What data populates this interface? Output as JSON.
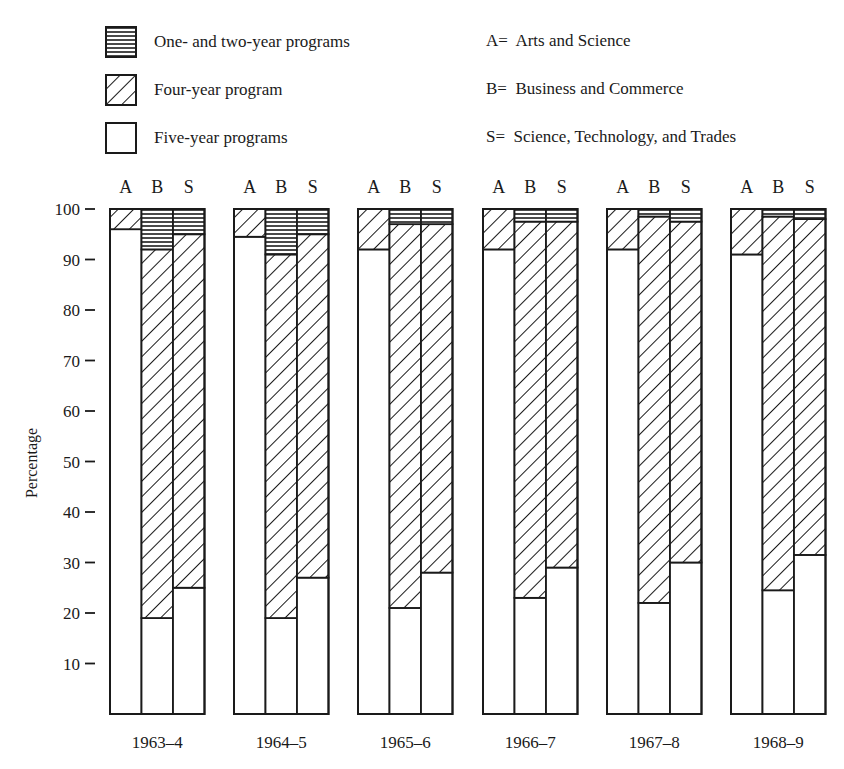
{
  "legend": {
    "series": [
      {
        "key": "one_two",
        "label": "One- and two-year programs",
        "pattern": "horizontal-lines"
      },
      {
        "key": "four",
        "label": "Four-year program",
        "pattern": "diagonal-hatch"
      },
      {
        "key": "five",
        "label": "Five-year programs",
        "pattern": "blank"
      }
    ],
    "keys": [
      {
        "letter": "A",
        "text": "A=  Arts and Science"
      },
      {
        "letter": "B",
        "text": "B=  Business and Commerce"
      },
      {
        "letter": "S",
        "text": "S=  Science, Technology, and Trades"
      }
    ]
  },
  "chart_data": {
    "type": "bar",
    "stacked": true,
    "title": "",
    "xlabel": "",
    "ylabel": "Percentage",
    "ylim": [
      0,
      100
    ],
    "yticks": [
      10,
      20,
      30,
      40,
      50,
      60,
      70,
      80,
      90,
      100
    ],
    "grid": false,
    "legend_position": "top",
    "categories": [
      "1963–4",
      "1964–5",
      "1965–6",
      "1966–7",
      "1967–8",
      "1968–9"
    ],
    "subcategories": [
      "A",
      "B",
      "S"
    ],
    "subcategory_names": {
      "A": "Arts and Science",
      "B": "Business and Commerce",
      "S": "Science, Technology, and Trades"
    },
    "series": [
      {
        "name": "Five-year programs",
        "key": "five",
        "values": {
          "A": [
            96,
            94.5,
            92,
            92,
            92,
            91
          ],
          "B": [
            19,
            19,
            21,
            23,
            22,
            24.5
          ],
          "S": [
            25,
            27,
            28,
            29,
            30,
            31.5
          ]
        }
      },
      {
        "name": "Four-year program",
        "key": "four",
        "values": {
          "A": [
            4,
            5.5,
            8,
            8,
            8,
            9
          ],
          "B": [
            73,
            72,
            76,
            74.5,
            76.5,
            74
          ],
          "S": [
            70,
            68,
            69,
            68.5,
            67.5,
            66.5
          ]
        }
      },
      {
        "name": "One- and two-year programs",
        "key": "one_two",
        "values": {
          "A": [
            0,
            0,
            0,
            0,
            0,
            0
          ],
          "B": [
            8,
            9,
            3,
            2.5,
            1.5,
            1.5
          ],
          "S": [
            5,
            5,
            3,
            2.5,
            2.5,
            2
          ]
        }
      }
    ]
  }
}
